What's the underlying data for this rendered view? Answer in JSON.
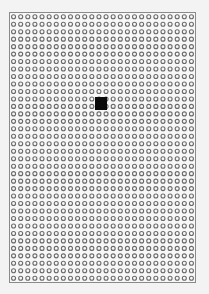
{
  "diagram": {
    "type": "perforated-grid",
    "grid": {
      "columns": 26,
      "rows": 36,
      "hole_color": "#6a6a6a",
      "background_color": "#f7f7f7",
      "border_color": "#8a8a8a"
    },
    "marker": {
      "shape": "square",
      "color": "#0a0a0a",
      "approx_column": 13,
      "approx_row": 12
    }
  }
}
